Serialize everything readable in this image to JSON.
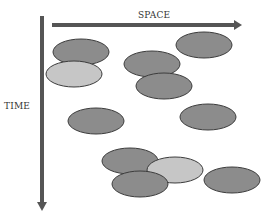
{
  "diagram": {
    "x_axis": {
      "label": "SPACE",
      "color": "#555555"
    },
    "y_axis": {
      "label": "TIME",
      "color": "#555555"
    },
    "colors": {
      "dark_fill": "#8c8c8c",
      "light_fill": "#c6c6c6",
      "stroke": "#3c3c3c"
    },
    "ellipses": [
      {
        "cx": 81,
        "cy": 52,
        "rx": 28,
        "ry": 13,
        "shade": "dark"
      },
      {
        "cx": 74,
        "cy": 74,
        "rx": 28,
        "ry": 13,
        "shade": "light"
      },
      {
        "cx": 152,
        "cy": 64,
        "rx": 28,
        "ry": 13,
        "shade": "dark"
      },
      {
        "cx": 164,
        "cy": 86,
        "rx": 28,
        "ry": 13,
        "shade": "dark"
      },
      {
        "cx": 204,
        "cy": 45,
        "rx": 28,
        "ry": 13,
        "shade": "dark"
      },
      {
        "cx": 96,
        "cy": 121,
        "rx": 28,
        "ry": 13,
        "shade": "dark"
      },
      {
        "cx": 208,
        "cy": 117,
        "rx": 28,
        "ry": 13,
        "shade": "dark"
      },
      {
        "cx": 130,
        "cy": 161,
        "rx": 28,
        "ry": 13,
        "shade": "dark"
      },
      {
        "cx": 175,
        "cy": 170,
        "rx": 28,
        "ry": 13,
        "shade": "light"
      },
      {
        "cx": 140,
        "cy": 184,
        "rx": 28,
        "ry": 13,
        "shade": "dark"
      },
      {
        "cx": 232,
        "cy": 180,
        "rx": 28,
        "ry": 13,
        "shade": "dark"
      }
    ]
  }
}
